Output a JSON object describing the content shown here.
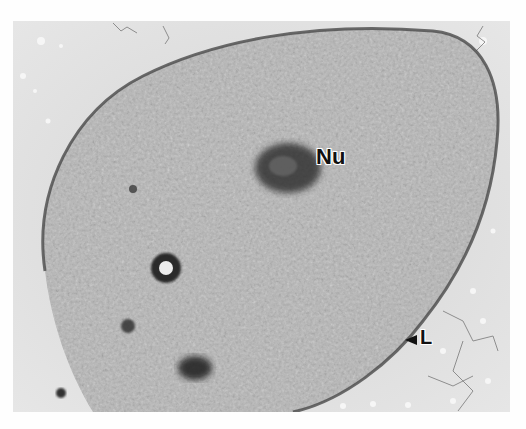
{
  "figure": {
    "type": "electron-micrograph",
    "labels": {
      "nucleolus": "Nu",
      "lamina": "L"
    },
    "colors": {
      "background": "#d9d9d9",
      "cytoplasm": "#b8b8b8",
      "dense_structures": "#2a2a2a",
      "border": "#fefefe"
    }
  }
}
